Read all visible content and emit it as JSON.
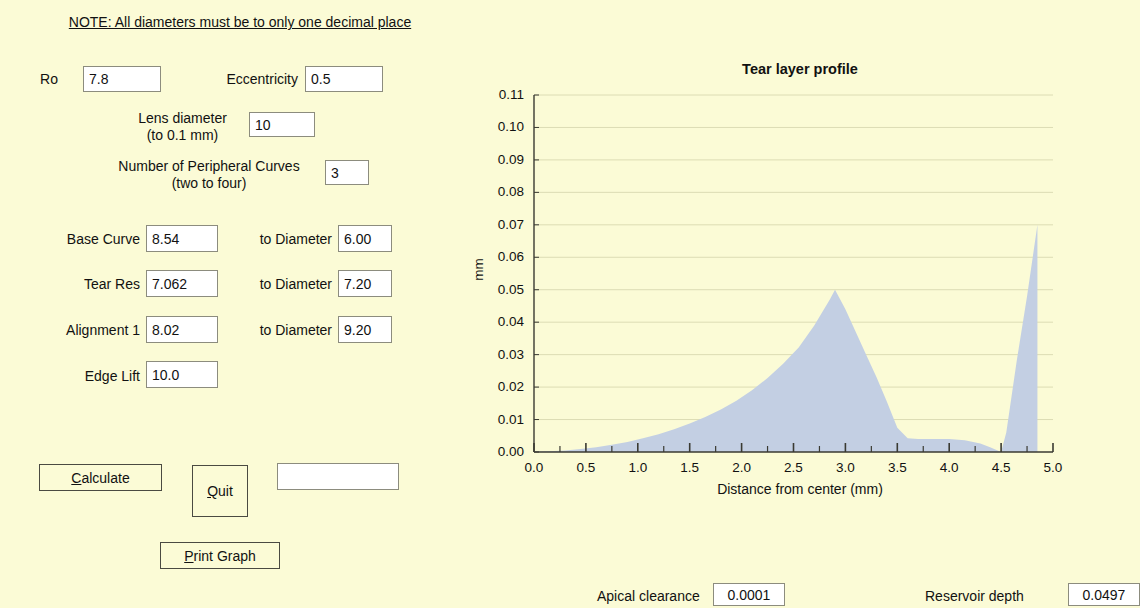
{
  "colors": {
    "background": "#fbfbd6",
    "fill": "#c3cfe3",
    "axis": "#3a3a32",
    "grid": "#dcdcb4",
    "input_bg": "#ffffff",
    "input_border": "#8c8c7e"
  },
  "note": {
    "text": "NOTE: All diameters must be to only one decimal place"
  },
  "form": {
    "ro_label": "Ro",
    "ro_value": "7.8",
    "eccentricity_label": "Eccentricity",
    "eccentricity_value": "0.5",
    "lens_diameter_label": "Lens diameter\n(to 0.1 mm)",
    "lens_diameter_value": "10",
    "peripheral_curves_label": "Number of Peripheral Curves\n(two to four)",
    "peripheral_curves_value": "3",
    "rows": [
      {
        "label": "Base Curve",
        "value": "8.54",
        "diameter_label": "to Diameter",
        "diameter_value": "6.00"
      },
      {
        "label": "Tear Res",
        "value": "7.062",
        "diameter_label": "to Diameter",
        "diameter_value": "7.20"
      },
      {
        "label": "Alignment 1",
        "value": "8.02",
        "diameter_label": "to Diameter",
        "diameter_value": "9.20"
      }
    ],
    "edge_lift_label": "Edge Lift",
    "edge_lift_value": "10.0"
  },
  "buttons": {
    "calculate": {
      "accel": "C",
      "rest": "alculate"
    },
    "quit": {
      "accel": "Q",
      "rest": "uit"
    },
    "print_graph": {
      "accel": "P",
      "rest": "rint Graph"
    }
  },
  "result_box": {
    "value": ""
  },
  "status": {
    "apical_clearance_label": "Apical clearance",
    "apical_clearance_value": "0.0001",
    "reservoir_depth_label": "Reservoir depth",
    "reservoir_depth_value": "0.0497"
  },
  "chart_data": {
    "type": "area",
    "title": "Tear layer profile",
    "xlabel": "Distance from center (mm)",
    "ylabel": "mm",
    "xlim": [
      0.0,
      5.0
    ],
    "ylim": [
      0.0,
      0.11
    ],
    "grid": true,
    "legend": null,
    "xticks": [
      "0.0",
      "0.5",
      "1.0",
      "1.5",
      "2.0",
      "2.5",
      "3.0",
      "3.5",
      "4.0",
      "4.5",
      "5.0"
    ],
    "xtick_values": [
      0.0,
      0.5,
      1.0,
      1.5,
      2.0,
      2.5,
      3.0,
      3.5,
      4.0,
      4.5,
      5.0
    ],
    "xminor_step": 0.25,
    "yticks": [
      "0.00",
      "0.01",
      "0.02",
      "0.03",
      "0.04",
      "0.05",
      "0.06",
      "0.07",
      "0.08",
      "0.09",
      "0.10",
      "0.11"
    ],
    "ytick_values": [
      0.0,
      0.01,
      0.02,
      0.03,
      0.04,
      0.05,
      0.06,
      0.07,
      0.08,
      0.09,
      0.1,
      0.11
    ],
    "series": [
      {
        "name": "Tear layer thickness",
        "x": [
          0.0,
          0.15,
          0.3,
          0.45,
          0.6,
          0.75,
          0.9,
          1.05,
          1.2,
          1.35,
          1.5,
          1.65,
          1.8,
          1.95,
          2.1,
          2.25,
          2.4,
          2.55,
          2.7,
          2.85,
          2.9,
          3.0,
          3.1,
          3.2,
          3.3,
          3.4,
          3.5,
          3.6,
          3.7,
          3.85,
          4.0,
          4.15,
          4.3,
          4.4,
          4.5,
          4.55,
          4.65,
          4.75,
          4.85,
          4.85
        ],
        "y": [
          0.0001,
          0.0002,
          0.0005,
          0.0009,
          0.0015,
          0.0022,
          0.0031,
          0.0042,
          0.0055,
          0.007,
          0.0088,
          0.0108,
          0.0131,
          0.0158,
          0.019,
          0.0228,
          0.0272,
          0.0322,
          0.039,
          0.047,
          0.05,
          0.044,
          0.037,
          0.03,
          0.023,
          0.0155,
          0.0075,
          0.0042,
          0.004,
          0.004,
          0.004,
          0.0036,
          0.0026,
          0.0014,
          0.0,
          0.006,
          0.028,
          0.048,
          0.07,
          0.0
        ]
      }
    ]
  }
}
